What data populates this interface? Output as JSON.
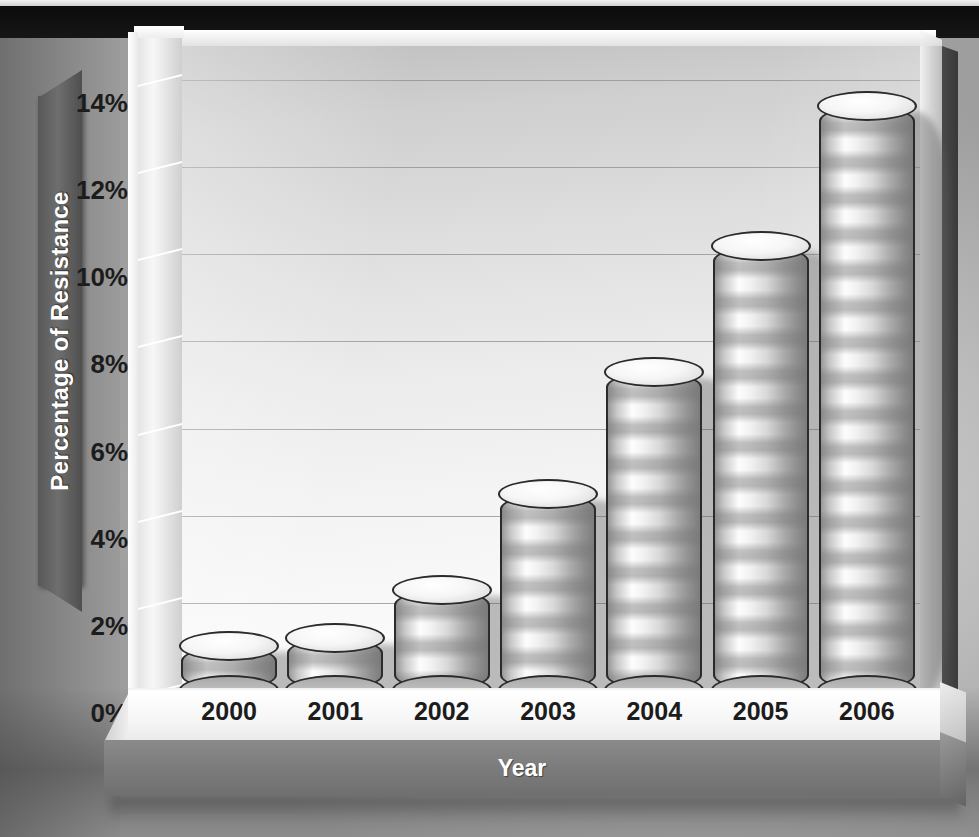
{
  "chart_data": {
    "type": "bar",
    "title": "",
    "subtitle": "",
    "xlabel": "Year",
    "ylabel": "Percentage of Resistance",
    "categories": [
      "2000",
      "2001",
      "2002",
      "2003",
      "2004",
      "2005",
      "2006"
    ],
    "values": [
      1.0,
      1.2,
      2.3,
      4.5,
      7.3,
      10.2,
      13.4
    ],
    "value_labels": [
      "1%",
      "1.2%",
      "2.3%",
      "4.5%",
      "7.3%",
      "10.2%",
      "13.4%"
    ],
    "yticks": [
      "0%",
      "2%",
      "4%",
      "6%",
      "8%",
      "10%",
      "12%",
      "14%"
    ],
    "ytick_values": [
      0,
      2,
      4,
      6,
      8,
      10,
      12,
      14
    ],
    "ylim": [
      0,
      14.6
    ],
    "grid": true,
    "legend": "none",
    "series": [
      {
        "name": "Percentage of Resistance",
        "values": [
          1.0,
          1.2,
          2.3,
          4.5,
          7.3,
          10.2,
          13.4
        ]
      }
    ],
    "style": "3d-cylinder",
    "colors": {
      "bar_light": "#fdfdfd",
      "bar_mid": "#c9c9c9",
      "bar_dark": "#7d7d7d",
      "bar_outline": "#2b2b2b",
      "plot_background": "#ececec",
      "axis_banner": "#5e5e5e",
      "axis_banner_text": "#ffffff",
      "tick_text": "#1c1c1c",
      "gridline": "#8e8e8e",
      "scene_background": "#bdbdbd",
      "top_band": "#101010"
    }
  },
  "axes": {
    "y_title": "Percentage of Resistance",
    "x_title": "Year"
  }
}
